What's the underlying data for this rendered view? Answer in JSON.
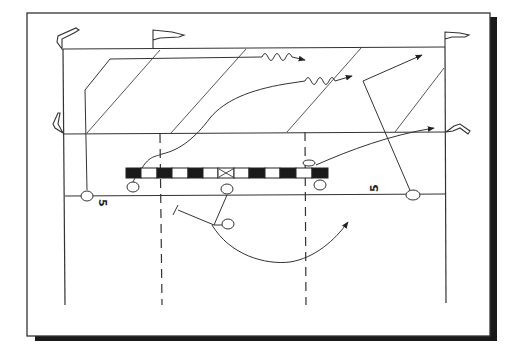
{
  "diagram": {
    "type": "football-play",
    "field": {
      "yard_markers": [
        {
          "label": "5",
          "side": "left",
          "rotation": 90
        },
        {
          "label": "5",
          "side": "right",
          "rotation": -90
        }
      ],
      "pylons": [
        "top-left",
        "top-mid",
        "top-right",
        "goal-left",
        "goal-right"
      ],
      "line_of_scrimmage": {
        "blocks": [
          "black",
          "white",
          "black",
          "white",
          "black",
          "white",
          "x",
          "white",
          "black",
          "white",
          "black",
          "white",
          "black"
        ]
      }
    },
    "players": [
      {
        "id": "wr-left",
        "role": "receiver",
        "route": "post-corner"
      },
      {
        "id": "te-left",
        "role": "tight-end",
        "route": "wiggle-crossing"
      },
      {
        "id": "qb",
        "role": "quarterback"
      },
      {
        "id": "rb",
        "role": "running-back",
        "route": "swing"
      },
      {
        "id": "te-right",
        "role": "tight-end",
        "route": "flat"
      },
      {
        "id": "wr-right",
        "role": "receiver",
        "route": "post"
      }
    ],
    "colors": {
      "ink": "#222222",
      "paper": "#ffffff",
      "shadow": "#1a1a1a"
    }
  }
}
